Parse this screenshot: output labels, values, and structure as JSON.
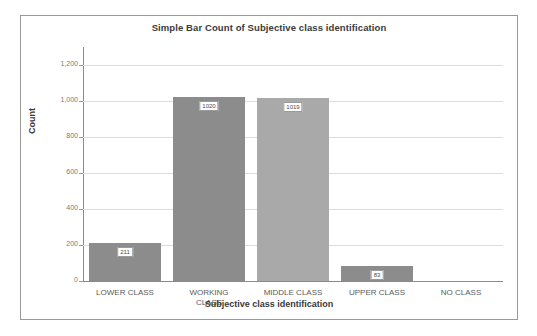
{
  "chart_data": {
    "type": "bar",
    "title": "Simple Bar Count of Subjective class identification",
    "xlabel": "Subjective class identification",
    "ylabel": "Count",
    "categories": [
      "LOWER CLASS",
      "WORKING\nCLASS",
      "MIDDLE CLASS",
      "UPPER CLASS",
      "NO CLASS"
    ],
    "values": [
      211,
      1020,
      1019,
      83,
      0
    ],
    "value_labels": [
      "211",
      "1020",
      "1019",
      "83",
      ""
    ],
    "bar_colors": [
      "#8c8c8c",
      "#8c8c8c",
      "#a9a9a9",
      "#8c8c8c",
      "#8c8c8c"
    ],
    "ylim": [
      0,
      1300
    ],
    "yticks": [
      0,
      200,
      400,
      600,
      800,
      1000,
      1200
    ],
    "ytick_labels": [
      "0",
      "200",
      "400",
      "600",
      "800",
      "1,000",
      "1,200"
    ],
    "grid": true,
    "legend": false
  },
  "style": {
    "frame_border_color": "#9a9a9a",
    "gridline_color": "#dcdcdc",
    "axis_color": "#8a8a8a",
    "title_color": "#3a3a3a",
    "tick_label_color": "#7a7a7a",
    "category_label_color": "#5a5a5a",
    "background": "#ffffff"
  }
}
